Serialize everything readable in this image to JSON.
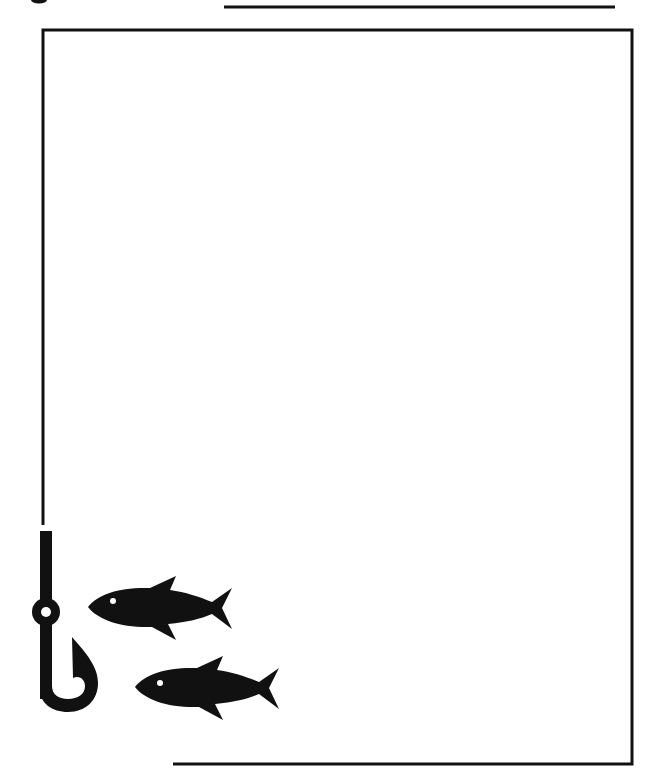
{
  "page": {
    "type": "blank decorative stationery page",
    "theme": "fishing",
    "background_color": "#ffffff",
    "ink_color": "#111111",
    "writing_area_content": ""
  },
  "decorations": {
    "top_fragment": {
      "description": "cut-off glyph fragment at top-left edge"
    },
    "top_rule": {
      "x1": 224,
      "x2": 615,
      "y": 7
    },
    "frame": {
      "left": 43,
      "top": 30,
      "right": 632,
      "bottom": 764,
      "left_line_ends_at_y": 525,
      "bottom_line_starts_at_x": 173,
      "stroke_width": 3
    },
    "fish_hook": {
      "icon": "fish-hook-icon",
      "eye_center": [
        46,
        612
      ]
    },
    "fish": [
      {
        "icon": "fish-icon",
        "nose": [
          88,
          607
        ],
        "eye": [
          113,
          601
        ]
      },
      {
        "icon": "fish-icon",
        "nose": [
          135,
          687
        ],
        "eye": [
          160,
          683
        ]
      }
    ]
  }
}
